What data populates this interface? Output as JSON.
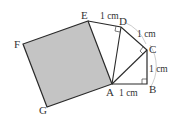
{
  "diagram": {
    "colors": {
      "square_fill": "#c4c4c4",
      "stroke": "#2a2a2a",
      "arc": "#aaaaaa"
    },
    "points": {
      "A": {
        "label": "A",
        "x": 112,
        "y": 84
      },
      "B": {
        "label": "B",
        "x": 147,
        "y": 84
      },
      "C": {
        "label": "C",
        "x": 147,
        "y": 50
      },
      "D": {
        "label": "D",
        "x": 121,
        "y": 27
      },
      "E": {
        "label": "E",
        "x": 88,
        "y": 21
      },
      "F": {
        "label": "F",
        "x": 23,
        "y": 44
      },
      "G": {
        "label": "G",
        "x": 47,
        "y": 107
      }
    },
    "segment_labels": {
      "ED": "1 cm",
      "DC": "1 cm",
      "CB": "1 cm",
      "AB": "1 cm"
    },
    "shaded_square": [
      "A",
      "E",
      "F",
      "G"
    ]
  }
}
